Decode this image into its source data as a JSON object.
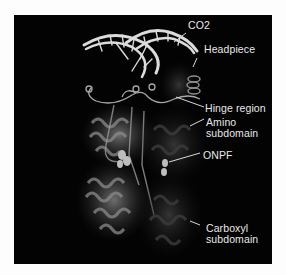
{
  "figure": {
    "background_color": "#030303",
    "label_color": "#e8e8e8",
    "labels": [
      {
        "id": "co2",
        "lines": [
          "CO2"
        ]
      },
      {
        "id": "headpiece",
        "lines": [
          "Headpiece"
        ]
      },
      {
        "id": "hinge",
        "lines": [
          "Hinge region"
        ]
      },
      {
        "id": "amino",
        "lines": [
          "Amino",
          "subdomain"
        ]
      },
      {
        "id": "onpf",
        "lines": [
          "ONPF"
        ]
      },
      {
        "id": "carboxyl",
        "lines": [
          "Carboxyl",
          "subdomain"
        ]
      }
    ]
  }
}
